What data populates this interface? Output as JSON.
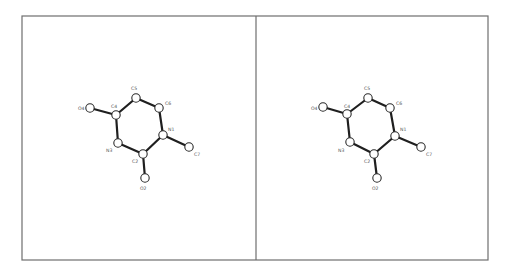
{
  "figure": {
    "type": "stereo-pair molecular drawing",
    "panels": [
      {
        "id": "left",
        "atoms": [
          {
            "name": "O4",
            "x": 90,
            "y": 108,
            "lx": 78,
            "ly": 110
          },
          {
            "name": "C4",
            "x": 116,
            "y": 115,
            "lx": 111,
            "ly": 108
          },
          {
            "name": "C5",
            "x": 136,
            "y": 98,
            "lx": 131,
            "ly": 90
          },
          {
            "name": "C6",
            "x": 159,
            "y": 108,
            "lx": 165,
            "ly": 105
          },
          {
            "name": "N1",
            "x": 163,
            "y": 135,
            "lx": 168,
            "ly": 131
          },
          {
            "name": "C7",
            "x": 189,
            "y": 147,
            "lx": 194,
            "ly": 156
          },
          {
            "name": "C2",
            "x": 143,
            "y": 154,
            "lx": 132,
            "ly": 163
          },
          {
            "name": "N3",
            "x": 118,
            "y": 143,
            "lx": 106,
            "ly": 152
          },
          {
            "name": "O2",
            "x": 145,
            "y": 178,
            "lx": 140,
            "ly": 190
          }
        ]
      },
      {
        "id": "right",
        "atoms": [
          {
            "name": "O4",
            "x": 323,
            "y": 107,
            "lx": 311,
            "ly": 110
          },
          {
            "name": "C4",
            "x": 347,
            "y": 114,
            "lx": 344,
            "ly": 108
          },
          {
            "name": "C5",
            "x": 368,
            "y": 98,
            "lx": 364,
            "ly": 90
          },
          {
            "name": "C6",
            "x": 390,
            "y": 108,
            "lx": 396,
            "ly": 105
          },
          {
            "name": "N1",
            "x": 395,
            "y": 136,
            "lx": 400,
            "ly": 131
          },
          {
            "name": "C7",
            "x": 421,
            "y": 147,
            "lx": 426,
            "ly": 156
          },
          {
            "name": "C2",
            "x": 374,
            "y": 154,
            "lx": 364,
            "ly": 163
          },
          {
            "name": "N3",
            "x": 350,
            "y": 142,
            "lx": 338,
            "ly": 152
          },
          {
            "name": "O2",
            "x": 377,
            "y": 178,
            "lx": 372,
            "ly": 190
          }
        ]
      }
    ],
    "bonds": [
      [
        "O4",
        "C4"
      ],
      [
        "C4",
        "C5"
      ],
      [
        "C5",
        "C6"
      ],
      [
        "C6",
        "N1"
      ],
      [
        "N1",
        "C7"
      ],
      [
        "N1",
        "C2"
      ],
      [
        "C2",
        "N3"
      ],
      [
        "N3",
        "C4"
      ],
      [
        "C2",
        "O2"
      ]
    ],
    "frame": {
      "left": 22,
      "top": 16,
      "right": 488,
      "bottom": 260,
      "divider_x": 256
    },
    "colors": {
      "frame": "#6e6e6e",
      "bond": "#1f1f1f",
      "atom_fill": "#ffffff",
      "label": "#555555"
    }
  }
}
